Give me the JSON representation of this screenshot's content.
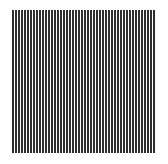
{
  "image": {
    "description": "Square pattern of vertical black-and-white stripes on a white background",
    "background_color": "#ffffff",
    "pattern": {
      "type": "vertical-stripes",
      "stripe_dark_color": "#2e2e2e",
      "stripe_light_color": "#ffffff",
      "period_px": 3,
      "dark_width_px": 2,
      "light_width_px": 1,
      "region": {
        "x": 12,
        "y": 10,
        "width": 143,
        "height": 143
      }
    }
  }
}
